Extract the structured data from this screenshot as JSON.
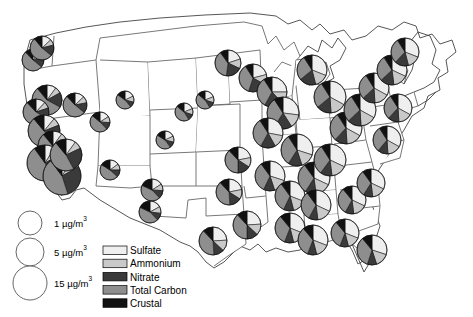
{
  "figure": {
    "title": "",
    "type": "proportional-symbol pie map",
    "region": "Contiguous United States"
  },
  "size_legend": {
    "name": "size-legend",
    "items": [
      {
        "label": "1 µg/m",
        "sup": "3",
        "value": 1,
        "radius_px": 12
      },
      {
        "label": "5 µg/m",
        "sup": "3",
        "value": 5,
        "radius_px": 14
      },
      {
        "label": "15 µg/m",
        "sup": "3",
        "value": 15,
        "radius_px": 17
      }
    ]
  },
  "species_legend": {
    "name": "species-legend",
    "items": [
      {
        "label": "Sulfate",
        "color": "#efefef"
      },
      {
        "label": "Ammonium",
        "color": "#c9c9c9"
      },
      {
        "label": "Nitrate",
        "color": "#3a3a3a"
      },
      {
        "label": "Total Carbon",
        "color": "#8e8e8e"
      },
      {
        "label": "Crustal",
        "color": "#111111"
      }
    ]
  },
  "chart_data": {
    "type": "pie",
    "title": "",
    "xlabel": "",
    "ylabel": "",
    "legend_position": "bottom-left",
    "units": "µg/m3",
    "series": [
      {
        "name": "Sulfate",
        "color": "#efefef"
      },
      {
        "name": "Ammonium",
        "color": "#c9c9c9"
      },
      {
        "name": "Nitrate",
        "color": "#3a3a3a"
      },
      {
        "name": "Total Carbon",
        "color": "#8e8e8e"
      },
      {
        "name": "Crustal",
        "color": "#111111"
      }
    ],
    "sites": [
      {
        "x": 47,
        "y": 100,
        "r": 15,
        "total": 9,
        "values": [
          10,
          7,
          16,
          56,
          11
        ]
      },
      {
        "x": 36,
        "y": 112,
        "r": 13,
        "total": 7,
        "values": [
          12,
          8,
          14,
          54,
          12
        ]
      },
      {
        "x": 33,
        "y": 60,
        "r": 11,
        "total": 5,
        "values": [
          14,
          9,
          13,
          52,
          12
        ]
      },
      {
        "x": 42,
        "y": 48,
        "r": 12,
        "total": 6,
        "values": [
          13,
          8,
          15,
          53,
          11
        ]
      },
      {
        "x": 44,
        "y": 131,
        "r": 16,
        "total": 10,
        "values": [
          11,
          8,
          20,
          50,
          11
        ]
      },
      {
        "x": 53,
        "y": 146,
        "r": 15,
        "total": 9,
        "values": [
          10,
          8,
          22,
          49,
          11
        ]
      },
      {
        "x": 45,
        "y": 163,
        "r": 18,
        "total": 13,
        "values": [
          9,
          8,
          26,
          47,
          10
        ]
      },
      {
        "x": 62,
        "y": 176,
        "r": 19,
        "total": 14,
        "values": [
          9,
          8,
          28,
          45,
          10
        ]
      },
      {
        "x": 66,
        "y": 155,
        "r": 16,
        "total": 10,
        "values": [
          10,
          8,
          24,
          47,
          11
        ]
      },
      {
        "x": 75,
        "y": 105,
        "r": 12,
        "total": 6,
        "values": [
          13,
          9,
          14,
          52,
          12
        ]
      },
      {
        "x": 100,
        "y": 122,
        "r": 10,
        "total": 4,
        "values": [
          16,
          10,
          12,
          48,
          14
        ]
      },
      {
        "x": 110,
        "y": 170,
        "r": 10,
        "total": 4,
        "values": [
          15,
          10,
          12,
          47,
          16
        ]
      },
      {
        "x": 152,
        "y": 190,
        "r": 11,
        "total": 5,
        "values": [
          16,
          10,
          12,
          44,
          18
        ]
      },
      {
        "x": 150,
        "y": 212,
        "r": 11,
        "total": 5,
        "values": [
          17,
          10,
          11,
          44,
          18
        ]
      },
      {
        "x": 125,
        "y": 100,
        "r": 9,
        "total": 3,
        "values": [
          18,
          11,
          10,
          46,
          15
        ]
      },
      {
        "x": 184,
        "y": 112,
        "r": 9,
        "total": 3,
        "values": [
          19,
          11,
          11,
          45,
          14
        ]
      },
      {
        "x": 228,
        "y": 63,
        "r": 13,
        "total": 7,
        "values": [
          20,
          12,
          20,
          38,
          10
        ]
      },
      {
        "x": 253,
        "y": 78,
        "r": 14,
        "total": 8,
        "values": [
          21,
          12,
          22,
          36,
          9
        ]
      },
      {
        "x": 238,
        "y": 160,
        "r": 13,
        "total": 7,
        "values": [
          22,
          12,
          16,
          38,
          12
        ]
      },
      {
        "x": 229,
        "y": 192,
        "r": 13,
        "total": 7,
        "values": [
          22,
          12,
          15,
          39,
          12
        ]
      },
      {
        "x": 247,
        "y": 225,
        "r": 14,
        "total": 8,
        "values": [
          24,
          13,
          13,
          38,
          12
        ]
      },
      {
        "x": 213,
        "y": 241,
        "r": 14,
        "total": 8,
        "values": [
          24,
          13,
          12,
          39,
          12
        ]
      },
      {
        "x": 272,
        "y": 92,
        "r": 15,
        "total": 9,
        "values": [
          25,
          13,
          20,
          33,
          9
        ]
      },
      {
        "x": 283,
        "y": 113,
        "r": 16,
        "total": 10,
        "values": [
          27,
          14,
          18,
          32,
          9
        ]
      },
      {
        "x": 268,
        "y": 133,
        "r": 15,
        "total": 9,
        "values": [
          28,
          14,
          16,
          33,
          9
        ]
      },
      {
        "x": 297,
        "y": 150,
        "r": 16,
        "total": 10,
        "values": [
          30,
          15,
          14,
          32,
          9
        ]
      },
      {
        "x": 270,
        "y": 176,
        "r": 15,
        "total": 9,
        "values": [
          30,
          15,
          12,
          33,
          10
        ]
      },
      {
        "x": 290,
        "y": 196,
        "r": 15,
        "total": 9,
        "values": [
          31,
          15,
          11,
          33,
          10
        ]
      },
      {
        "x": 314,
        "y": 178,
        "r": 16,
        "total": 10,
        "values": [
          32,
          16,
          11,
          31,
          10
        ]
      },
      {
        "x": 330,
        "y": 160,
        "r": 16,
        "total": 10,
        "values": [
          32,
          16,
          12,
          31,
          9
        ]
      },
      {
        "x": 316,
        "y": 205,
        "r": 15,
        "total": 9,
        "values": [
          32,
          16,
          10,
          32,
          10
        ]
      },
      {
        "x": 290,
        "y": 228,
        "r": 15,
        "total": 9,
        "values": [
          31,
          15,
          10,
          33,
          11
        ]
      },
      {
        "x": 313,
        "y": 240,
        "r": 15,
        "total": 9,
        "values": [
          31,
          15,
          10,
          33,
          11
        ]
      },
      {
        "x": 345,
        "y": 233,
        "r": 14,
        "total": 8,
        "values": [
          31,
          15,
          10,
          33,
          11
        ]
      },
      {
        "x": 372,
        "y": 250,
        "r": 15,
        "total": 9,
        "values": [
          30,
          15,
          10,
          34,
          11
        ]
      },
      {
        "x": 352,
        "y": 200,
        "r": 14,
        "total": 8,
        "values": [
          32,
          16,
          10,
          31,
          11
        ]
      },
      {
        "x": 371,
        "y": 183,
        "r": 14,
        "total": 8,
        "values": [
          32,
          16,
          11,
          31,
          10
        ]
      },
      {
        "x": 346,
        "y": 128,
        "r": 16,
        "total": 10,
        "values": [
          33,
          16,
          13,
          29,
          9
        ]
      },
      {
        "x": 360,
        "y": 110,
        "r": 16,
        "total": 10,
        "values": [
          33,
          16,
          14,
          28,
          9
        ]
      },
      {
        "x": 330,
        "y": 97,
        "r": 16,
        "total": 10,
        "values": [
          33,
          16,
          15,
          27,
          9
        ]
      },
      {
        "x": 312,
        "y": 70,
        "r": 15,
        "total": 9,
        "values": [
          31,
          15,
          18,
          27,
          9
        ]
      },
      {
        "x": 374,
        "y": 88,
        "r": 15,
        "total": 9,
        "values": [
          33,
          16,
          14,
          28,
          9
        ]
      },
      {
        "x": 392,
        "y": 70,
        "r": 15,
        "total": 9,
        "values": [
          32,
          16,
          15,
          28,
          9
        ]
      },
      {
        "x": 405,
        "y": 52,
        "r": 14,
        "total": 8,
        "values": [
          31,
          15,
          16,
          29,
          9
        ]
      },
      {
        "x": 398,
        "y": 108,
        "r": 14,
        "total": 8,
        "values": [
          33,
          16,
          13,
          29,
          9
        ]
      },
      {
        "x": 387,
        "y": 140,
        "r": 14,
        "total": 8,
        "values": [
          33,
          16,
          12,
          30,
          9
        ]
      },
      {
        "x": 205,
        "y": 100,
        "r": 9,
        "total": 3,
        "values": [
          19,
          11,
          11,
          45,
          14
        ]
      },
      {
        "x": 165,
        "y": 140,
        "r": 9,
        "total": 3,
        "values": [
          18,
          11,
          11,
          44,
          16
        ]
      }
    ]
  }
}
